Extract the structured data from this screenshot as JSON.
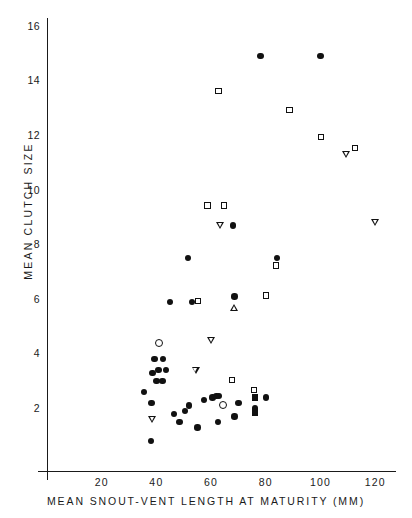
{
  "chart_data": {
    "type": "scatter",
    "title": "",
    "xlabel": "MEAN SNOUT-VENT LENGTH AT MATURITY (MM)",
    "ylabel": "MEAN CLUTCH SIZE",
    "xlim": [
      0,
      131
    ],
    "ylim": [
      0,
      16.6
    ],
    "grid": false,
    "legend": "none",
    "x_major_ticks": [
      20,
      40,
      60,
      80,
      100,
      120
    ],
    "x_minor_ticks": [
      10,
      30,
      50,
      70,
      90,
      110,
      130
    ],
    "x_tick_labels": [
      "20",
      "40",
      "60",
      "80",
      "100",
      "120"
    ],
    "y_major_ticks": [
      2,
      4,
      6,
      8,
      10,
      12,
      14,
      16
    ],
    "y_minor_ticks": [
      1,
      3,
      5,
      7,
      9,
      11,
      13,
      15
    ],
    "y_tick_labels": [
      "2",
      "4",
      "6",
      "8",
      "10",
      "12",
      "14",
      "16"
    ],
    "marker_types": [
      "filled-circle",
      "open-circle",
      "open-square",
      "filled-square",
      "open-tri-down",
      "open-tri-up"
    ],
    "points": [
      {
        "x": 38.0,
        "y": 0.8,
        "m": "filled-circle"
      },
      {
        "x": 38.5,
        "y": 1.6,
        "m": "open-tri-down"
      },
      {
        "x": 38.2,
        "y": 2.2,
        "m": "filled-circle"
      },
      {
        "x": 35.5,
        "y": 2.6,
        "m": "filled-circle"
      },
      {
        "x": 40.0,
        "y": 3.0,
        "m": "filled-circle"
      },
      {
        "x": 42.2,
        "y": 3.0,
        "m": "filled-circle"
      },
      {
        "x": 38.5,
        "y": 3.3,
        "m": "filled-circle"
      },
      {
        "x": 40.8,
        "y": 3.4,
        "m": "filled-circle"
      },
      {
        "x": 43.5,
        "y": 3.4,
        "m": "filled-circle"
      },
      {
        "x": 39.3,
        "y": 3.8,
        "m": "filled-circle"
      },
      {
        "x": 42.5,
        "y": 3.8,
        "m": "filled-circle"
      },
      {
        "x": 41.0,
        "y": 4.4,
        "m": "open-circle"
      },
      {
        "x": 45.0,
        "y": 5.9,
        "m": "filled-circle"
      },
      {
        "x": 46.5,
        "y": 1.8,
        "m": "filled-circle"
      },
      {
        "x": 48.5,
        "y": 1.5,
        "m": "filled-circle"
      },
      {
        "x": 50.5,
        "y": 1.9,
        "m": "filled-circle"
      },
      {
        "x": 52.0,
        "y": 2.1,
        "m": "filled-circle"
      },
      {
        "x": 51.6,
        "y": 7.5,
        "m": "filled-circle"
      },
      {
        "x": 53.0,
        "y": 5.9,
        "m": "filled-circle"
      },
      {
        "x": 55.5,
        "y": 5.9,
        "m": "open-square"
      },
      {
        "x": 54.5,
        "y": 3.4,
        "m": "open-tri-down"
      },
      {
        "x": 55.0,
        "y": 1.3,
        "m": "filled-circle"
      },
      {
        "x": 57.5,
        "y": 2.3,
        "m": "filled-circle"
      },
      {
        "x": 59.0,
        "y": 9.4,
        "m": "open-square"
      },
      {
        "x": 60.0,
        "y": 4.5,
        "m": "open-tri-down"
      },
      {
        "x": 60.5,
        "y": 2.4,
        "m": "filled-circle"
      },
      {
        "x": 62.0,
        "y": 2.45,
        "m": "filled-circle"
      },
      {
        "x": 62.8,
        "y": 2.45,
        "m": "filled-circle"
      },
      {
        "x": 62.5,
        "y": 1.5,
        "m": "filled-circle"
      },
      {
        "x": 63.0,
        "y": 13.6,
        "m": "open-square"
      },
      {
        "x": 65.0,
        "y": 9.4,
        "m": "open-square"
      },
      {
        "x": 63.5,
        "y": 8.7,
        "m": "open-tri-down"
      },
      {
        "x": 64.5,
        "y": 2.1,
        "m": "open-circle"
      },
      {
        "x": 68.0,
        "y": 8.7,
        "m": "filled-circle"
      },
      {
        "x": 68.5,
        "y": 6.1,
        "m": "filled-circle"
      },
      {
        "x": 68.5,
        "y": 5.7,
        "m": "open-tri-up"
      },
      {
        "x": 68.0,
        "y": 3.0,
        "m": "open-square"
      },
      {
        "x": 68.5,
        "y": 1.7,
        "m": "filled-circle"
      },
      {
        "x": 70.0,
        "y": 2.2,
        "m": "filled-circle"
      },
      {
        "x": 76.0,
        "y": 2.65,
        "m": "open-square"
      },
      {
        "x": 76.0,
        "y": 2.4,
        "m": "filled-square"
      },
      {
        "x": 76.0,
        "y": 2.0,
        "m": "filled-circle"
      },
      {
        "x": 76.0,
        "y": 1.85,
        "m": "filled-square"
      },
      {
        "x": 80.0,
        "y": 2.4,
        "m": "filled-circle"
      },
      {
        "x": 78.0,
        "y": 14.9,
        "m": "filled-circle"
      },
      {
        "x": 80.5,
        "y": 6.1,
        "m": "open-square"
      },
      {
        "x": 84.0,
        "y": 7.5,
        "m": "filled-circle"
      },
      {
        "x": 84.0,
        "y": 7.2,
        "m": "open-square"
      },
      {
        "x": 89.0,
        "y": 12.9,
        "m": "open-square"
      },
      {
        "x": 100.0,
        "y": 14.9,
        "m": "filled-circle"
      },
      {
        "x": 100.5,
        "y": 11.9,
        "m": "open-square"
      },
      {
        "x": 109.5,
        "y": 11.3,
        "m": "open-tri-down"
      },
      {
        "x": 113.0,
        "y": 11.5,
        "m": "open-square"
      },
      {
        "x": 120.0,
        "y": 8.8,
        "m": "open-tri-down"
      }
    ]
  }
}
